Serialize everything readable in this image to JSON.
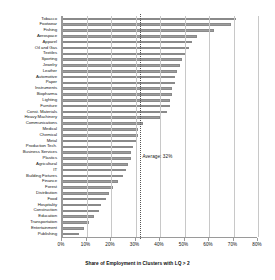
{
  "chart_data": {
    "type": "bar",
    "orientation": "horizontal",
    "title": "",
    "xlabel": "Share of Employment in Clusters with LQ > 2",
    "ylabel": "",
    "xlim": [
      0,
      80
    ],
    "xtick_labels": [
      "0%",
      "10%",
      "20%",
      "30%",
      "40%",
      "50%",
      "60%",
      "70%",
      "80%"
    ],
    "xticks": [
      0,
      10,
      20,
      30,
      40,
      50,
      60,
      70,
      80
    ],
    "grid": true,
    "legend": "none",
    "value_suffix": "%",
    "annotations": [
      {
        "label": "Average: 32%",
        "value": 32,
        "style": "dotted-vertical-line"
      }
    ],
    "categories": [
      "Tobacco",
      "Footwear",
      "Fishing",
      "Aerospace",
      "Apparel",
      "Oil and Gas",
      "Textiles",
      "Sporting",
      "Jewelry",
      "Leather",
      "Automotive",
      "Paper",
      "Instruments",
      "Biopharma",
      "Lighting",
      "Furniture",
      "Const. Materials",
      "Heavy Machinery",
      "Communications",
      "Medical",
      "Chemical",
      "Metal",
      "Production Tech.",
      "Business Services",
      "Plastics",
      "Agricultural",
      "IT",
      "Building Fixtures",
      "Finance",
      "Forest",
      "Distribution",
      "Food",
      "Hospitality",
      "Construction",
      "Education",
      "Transportation",
      "Entertainment",
      "Publishing"
    ],
    "values": [
      71,
      69,
      62,
      55,
      53,
      52,
      50,
      49,
      48,
      47,
      46,
      46,
      45,
      45,
      44,
      44,
      43,
      40,
      33,
      31,
      31,
      30,
      29,
      28,
      28,
      27,
      26,
      25,
      23,
      21,
      19,
      18,
      16,
      15,
      13,
      11,
      9,
      7
    ]
  },
  "axis": {
    "title": "Share of Employment in Clusters with LQ > 2"
  }
}
